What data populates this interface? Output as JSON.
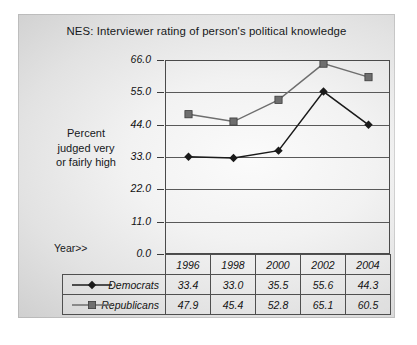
{
  "chart_data": {
    "type": "line",
    "title": "NES:  Interviewer rating of person's political knowledge",
    "xlabel": "Year>>",
    "ylabel": "Percent judged very or fairly high",
    "ylabel_lines": [
      "Percent",
      "judged very",
      "or fairly high"
    ],
    "categories": [
      "1996",
      "1998",
      "2000",
      "2002",
      "2004"
    ],
    "series": [
      {
        "name": "Democrats",
        "values": [
          33.4,
          33.0,
          35.5,
          55.6,
          44.3
        ],
        "marker": "diamond",
        "color": "#1a1a1a"
      },
      {
        "name": "Republicans",
        "values": [
          47.9,
          45.4,
          52.8,
          65.1,
          60.5
        ],
        "marker": "square",
        "color": "#6e6e6e"
      }
    ],
    "ylim": [
      0.0,
      66.0
    ],
    "yticks": [
      "0.0",
      "11.0",
      "22.0",
      "33.0",
      "44.0",
      "55.0",
      "66.0"
    ],
    "ytick_values": [
      0.0,
      11.0,
      22.0,
      33.0,
      44.0,
      55.0,
      66.0
    ],
    "grid": true,
    "legend_position": "table-left"
  },
  "table": {
    "year_label": "Year>>",
    "columns": [
      "1996",
      "1998",
      "2000",
      "2002",
      "2004"
    ],
    "rows": [
      {
        "label": "Democrats",
        "cells": [
          "33.4",
          "33.0",
          "35.5",
          "55.6",
          "44.3"
        ]
      },
      {
        "label": "Republicans",
        "cells": [
          "47.9",
          "45.4",
          "52.8",
          "65.1",
          "60.5"
        ]
      }
    ]
  },
  "colors": {
    "democrats": "#1a1a1a",
    "republicans": "#6e6e6e",
    "axis": "#4a4a4a",
    "grid": "#595959"
  }
}
